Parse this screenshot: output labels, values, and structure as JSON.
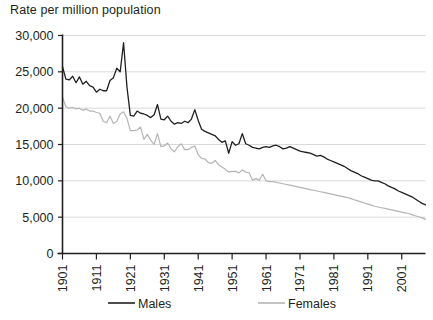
{
  "chart_data": {
    "type": "line",
    "title": "Rate per million population",
    "xlabel": "",
    "ylabel": "Rate per million population",
    "ylim": [
      0,
      30000
    ],
    "xlim": [
      1901,
      2008
    ],
    "grid": true,
    "legend_position": "bottom",
    "y_ticks": [
      0,
      5000,
      10000,
      15000,
      20000,
      25000,
      30000
    ],
    "y_tick_labels": [
      "0",
      "5,000",
      "10,000",
      "15,000",
      "20,000",
      "25,000",
      "30,000"
    ],
    "x_ticks": [
      1901,
      1911,
      1921,
      1931,
      1941,
      1951,
      1961,
      1971,
      1981,
      1991,
      2001
    ],
    "x_tick_labels": [
      "1901",
      "1911",
      "1921",
      "1931",
      "1941",
      "1951",
      "1961",
      "1971",
      "1981",
      "1991",
      "2001"
    ],
    "x": [
      1901,
      1902,
      1903,
      1904,
      1905,
      1906,
      1907,
      1908,
      1909,
      1910,
      1911,
      1912,
      1913,
      1914,
      1915,
      1916,
      1917,
      1918,
      1919,
      1920,
      1921,
      1922,
      1923,
      1924,
      1925,
      1926,
      1927,
      1928,
      1929,
      1930,
      1931,
      1932,
      1933,
      1934,
      1935,
      1936,
      1937,
      1938,
      1939,
      1940,
      1941,
      1942,
      1943,
      1944,
      1945,
      1946,
      1947,
      1948,
      1949,
      1950,
      1951,
      1952,
      1953,
      1954,
      1955,
      1956,
      1957,
      1958,
      1959,
      1960,
      1961,
      1962,
      1963,
      1964,
      1965,
      1966,
      1967,
      1968,
      1969,
      1970,
      1971,
      1972,
      1973,
      1974,
      1975,
      1976,
      1977,
      1978,
      1979,
      1980,
      1981,
      1982,
      1983,
      1984,
      1985,
      1986,
      1987,
      1988,
      1989,
      1990,
      1991,
      1992,
      1993,
      1994,
      1995,
      1996,
      1997,
      1998,
      1999,
      2000,
      2001,
      2002,
      2003,
      2004,
      2005,
      2006,
      2007,
      2008
    ],
    "series": [
      {
        "name": "Males",
        "color": "#231f20",
        "values": [
          25700,
          24000,
          23900,
          24400,
          23500,
          24300,
          23300,
          23700,
          23100,
          22900,
          22200,
          22600,
          22400,
          22400,
          23800,
          24200,
          25500,
          25000,
          29000,
          22900,
          19000,
          18900,
          19600,
          19300,
          19200,
          19000,
          18700,
          19100,
          20500,
          18500,
          18400,
          18900,
          18200,
          17800,
          18000,
          17900,
          18200,
          18000,
          18500,
          19800,
          18300,
          17100,
          16800,
          16600,
          16400,
          16200,
          15700,
          15300,
          15500,
          13800,
          15400,
          14900,
          15100,
          16500,
          15100,
          14900,
          14600,
          14500,
          14400,
          14600,
          14700,
          14600,
          14800,
          14900,
          14700,
          14400,
          14500,
          14700,
          14500,
          14300,
          14100,
          14000,
          13900,
          13800,
          13600,
          13400,
          13500,
          13300,
          13000,
          12800,
          12600,
          12400,
          12200,
          12000,
          11700,
          11400,
          11200,
          11000,
          10700,
          10500,
          10300,
          10100,
          10000,
          10000,
          9800,
          9600,
          9300,
          9100,
          8900,
          8600,
          8400,
          8200,
          8000,
          7800,
          7500,
          7200,
          6900,
          6700
        ]
      },
      {
        "name": "Females",
        "color": "#b5b5b5",
        "values": [
          21500,
          20200,
          20000,
          20100,
          19900,
          20000,
          19700,
          19900,
          19600,
          19600,
          19400,
          19300,
          18200,
          18000,
          18900,
          17900,
          18200,
          19200,
          19500,
          18600,
          16900,
          16900,
          17000,
          17400,
          15700,
          16400,
          15600,
          15000,
          16500,
          14700,
          14800,
          15200,
          14400,
          14000,
          14700,
          15100,
          14300,
          14300,
          14600,
          14800,
          13600,
          13100,
          13000,
          12500,
          12400,
          12800,
          12200,
          11900,
          11600,
          11200,
          11300,
          11300,
          11100,
          11500,
          11200,
          11100,
          10100,
          10300,
          10100,
          10900,
          10000,
          9900,
          9900,
          9800,
          9700,
          9600,
          9500,
          9400,
          9300,
          9200,
          9100,
          9000,
          8900,
          8800,
          8700,
          8600,
          8500,
          8400,
          8300,
          8200,
          8100,
          8000,
          7900,
          7800,
          7700,
          7550,
          7400,
          7250,
          7100,
          6950,
          6800,
          6650,
          6500,
          6400,
          6300,
          6200,
          6100,
          6000,
          5900,
          5800,
          5700,
          5600,
          5500,
          5350,
          5200,
          5050,
          4900,
          4700
        ]
      }
    ]
  },
  "legend": {
    "items": [
      {
        "label": "Males",
        "color": "#231f20"
      },
      {
        "label": "Females",
        "color": "#b5b5b5"
      }
    ]
  }
}
